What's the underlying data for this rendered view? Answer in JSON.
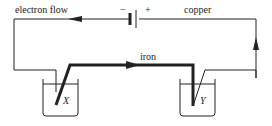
{
  "diagram": {
    "labels": {
      "electron_flow": "electron flow",
      "minus": "−",
      "plus": "+",
      "copper": "copper",
      "iron": "iron",
      "beaker_left": "X",
      "beaker_right": "Y"
    },
    "colors": {
      "wire": "#222222",
      "background": "#ffffff"
    }
  }
}
